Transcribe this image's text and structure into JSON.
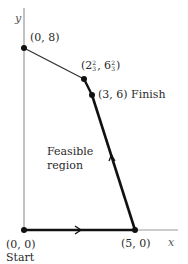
{
  "axes": {
    "x_label": "x",
    "y_label": "y"
  },
  "points": [
    {
      "id": "origin",
      "label": "(0, 0)",
      "sub_label": "Start",
      "x": 0,
      "y": 0
    },
    {
      "id": "p5_0",
      "label": "(5, 0)",
      "x": 5,
      "y": 0
    },
    {
      "id": "p3_6",
      "label": "(3, 6)",
      "sub_label": "Finish",
      "x": 3,
      "y": 6
    },
    {
      "id": "p2_6",
      "label_prefix": "(2",
      "frac1_num": "2",
      "frac1_den": "3",
      "label_mid": ", 6",
      "frac2_num": "2",
      "frac2_den": "3",
      "label_suffix": ")",
      "x": 2.667,
      "y": 6.667
    },
    {
      "id": "p0_8",
      "label": "(0, 8)",
      "x": 0,
      "y": 8
    }
  ],
  "region_label": {
    "line1": "Feasible",
    "line2": "region"
  },
  "colors": {
    "axis": "#999999",
    "path": "#111111",
    "boundary": "#333333"
  }
}
